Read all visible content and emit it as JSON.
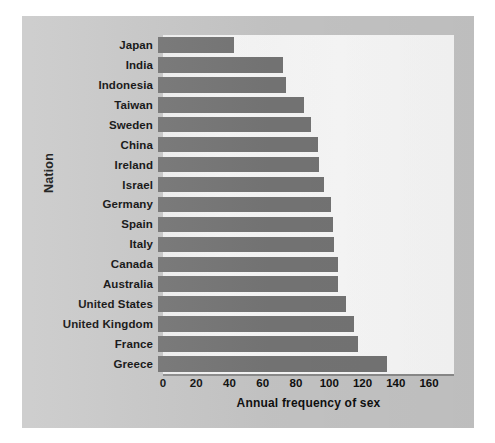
{
  "chart_data": {
    "type": "bar",
    "orientation": "horizontal",
    "title": "",
    "xlabel": "Annual frequency of sex",
    "ylabel": "Nation",
    "xlim": [
      0,
      175
    ],
    "xticks": [
      0,
      20,
      40,
      60,
      80,
      100,
      120,
      140,
      160
    ],
    "grid": false,
    "legend": null,
    "bar_color": "#777777",
    "panel_color": "#ffffff",
    "background_color": "#c9c9c9",
    "categories": [
      "Japan",
      "India",
      "Indonesia",
      "Taiwan",
      "Sweden",
      "China",
      "Ireland",
      "Israel",
      "Germany",
      "Spain",
      "Italy",
      "Canada",
      "Australia",
      "United States",
      "United  Kingdom",
      "France",
      "Greece"
    ],
    "values": [
      46,
      75,
      77,
      88,
      92,
      96,
      97,
      100,
      104,
      105,
      106,
      108,
      108,
      113,
      118,
      120,
      138
    ]
  }
}
